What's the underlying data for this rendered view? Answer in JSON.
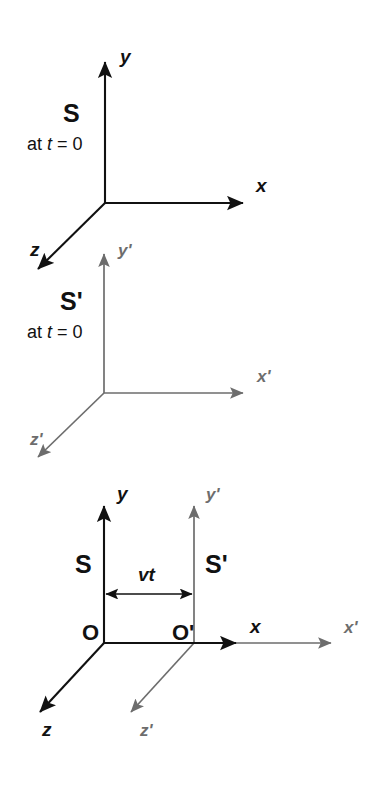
{
  "figure": {
    "width": 377,
    "height": 785,
    "background": "#ffffff",
    "colors": {
      "frame_s": "#111111",
      "frame_s_prime": "#6d6d6d"
    }
  },
  "panels": [
    {
      "id": "panel-s",
      "frame_label": "S",
      "time_prefix": "at ",
      "time_var": "t",
      "time_rest": " = 0",
      "color": "#111111",
      "origin": {
        "x": 105,
        "y": 203
      },
      "axes": [
        {
          "name": "y",
          "label": "y",
          "tip": {
            "x": 105,
            "y": 58
          },
          "label_pos": {
            "x": 120,
            "y": 63
          }
        },
        {
          "name": "x",
          "label": "x",
          "tip": {
            "x": 247,
            "y": 203
          },
          "label_pos": {
            "x": 256,
            "y": 192
          }
        },
        {
          "name": "z",
          "label": "z",
          "tip": {
            "x": 35,
            "y": 272
          },
          "label_pos": {
            "x": 30,
            "y": 256
          }
        }
      ],
      "frame_label_pos": {
        "x": 63,
        "y": 122
      },
      "time_label_pos": {
        "x": 27,
        "y": 150
      }
    },
    {
      "id": "panel-s-prime",
      "frame_label": "S'",
      "time_prefix": "at ",
      "time_var": "t",
      "time_rest": " = 0",
      "color": "#6d6d6d",
      "origin": {
        "x": 104,
        "y": 393
      },
      "axes": [
        {
          "name": "y-prime",
          "label": "y'",
          "tip": {
            "x": 104,
            "y": 250
          },
          "label_pos": {
            "x": 118,
            "y": 256
          }
        },
        {
          "name": "x-prime",
          "label": "x'",
          "tip": {
            "x": 247,
            "y": 393
          },
          "label_pos": {
            "x": 257,
            "y": 382
          }
        },
        {
          "name": "z-prime",
          "label": "z'",
          "tip": {
            "x": 35,
            "y": 460
          },
          "label_pos": {
            "x": 30,
            "y": 445
          }
        }
      ],
      "frame_label_pos": {
        "x": 63,
        "y": 310
      },
      "time_label_pos": {
        "x": 27,
        "y": 338
      }
    },
    {
      "id": "panel-combined",
      "color_s": "#111111",
      "color_s_prime": "#6d6d6d",
      "frame_s": {
        "label": "S",
        "label_pos": {
          "x": 75,
          "y": 573
        },
        "origin": {
          "x": 104,
          "y": 643
        },
        "origin_label": "O",
        "origin_label_pos": {
          "x": 82,
          "y": 640
        },
        "axes": [
          {
            "name": "y",
            "label": "y",
            "tip": {
              "x": 104,
              "y": 502
            },
            "label_pos": {
              "x": 117,
              "y": 500
            }
          },
          {
            "name": "x",
            "label": "x",
            "tip": {
              "x": 240,
              "y": 643
            },
            "label_pos": {
              "x": 250,
              "y": 633
            }
          },
          {
            "name": "z",
            "label": "z",
            "tip": {
              "x": 37,
              "y": 715
            },
            "label_pos": {
              "x": 42,
              "y": 736
            }
          }
        ]
      },
      "frame_s_prime": {
        "label": "S'",
        "label_pos": {
          "x": 205,
          "y": 573
        },
        "origin": {
          "x": 194,
          "y": 643
        },
        "origin_label": "O'",
        "origin_label_pos": {
          "x": 172,
          "y": 640
        },
        "axes": [
          {
            "name": "y-prime",
            "label": "y'",
            "tip": {
              "x": 194,
              "y": 502
            },
            "label_pos": {
              "x": 206,
              "y": 500
            }
          },
          {
            "name": "x-prime",
            "label": "x'",
            "tip": {
              "x": 335,
              "y": 643
            },
            "label_pos": {
              "x": 344,
              "y": 633
            }
          },
          {
            "name": "z-prime",
            "label": "z'",
            "tip": {
              "x": 128,
              "y": 715
            },
            "label_pos": {
              "x": 140,
              "y": 736
            }
          }
        ]
      },
      "displacement": {
        "label": "vt",
        "label_pos": {
          "x": 138,
          "y": 581
        },
        "from": {
          "x": 104,
          "y": 594
        },
        "to": {
          "x": 194,
          "y": 594
        }
      }
    }
  ]
}
